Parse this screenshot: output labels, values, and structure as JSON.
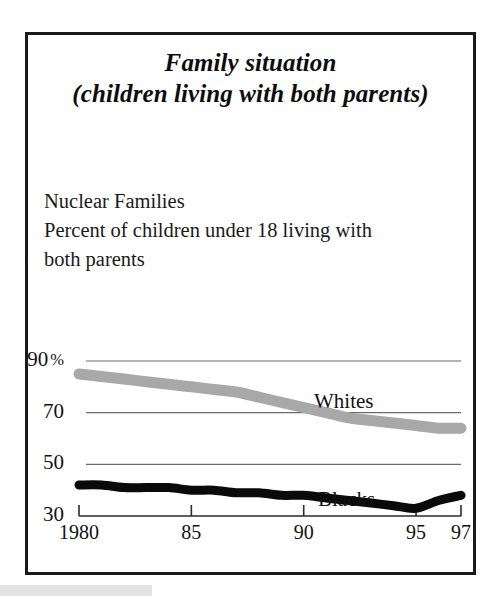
{
  "figure": {
    "title_line_1": "Family situation",
    "title_line_2": "(children living with both parents)",
    "caption_line_1": "Nuclear Families",
    "caption_line_2": "Percent of children under 18 living with",
    "caption_line_3": "both parents"
  },
  "colors": {
    "whites_series": "#a8a8a8",
    "blacks_series": "#0a0a0a",
    "gridline": "#6b6b6b",
    "frame": "#1a1a1a",
    "bottom_bar": "#e3e3e3"
  },
  "chart_data": {
    "type": "line",
    "title": "Family situation (children living with both parents)",
    "subtitle": "Nuclear Families — Percent of children under 18 living with both parents",
    "xlabel": "",
    "ylabel": "",
    "xlim": [
      1980,
      1997
    ],
    "ylim": [
      30,
      90
    ],
    "grid": true,
    "legend_position": "inline-labels",
    "y_ticks": [
      {
        "value": 90,
        "label": "90",
        "suffix": "%"
      },
      {
        "value": 70,
        "label": "70",
        "suffix": ""
      },
      {
        "value": 50,
        "label": "50",
        "suffix": ""
      },
      {
        "value": 30,
        "label": "30",
        "suffix": ""
      }
    ],
    "x_ticks": [
      {
        "value": 1980,
        "label": "1980"
      },
      {
        "value": 1985,
        "label": "85"
      },
      {
        "value": 1990,
        "label": "90"
      },
      {
        "value": 1995,
        "label": "95"
      },
      {
        "value": 1997,
        "label": "97"
      }
    ],
    "x": [
      1980,
      1981,
      1982,
      1983,
      1984,
      1985,
      1986,
      1987,
      1988,
      1989,
      1990,
      1991,
      1992,
      1993,
      1994,
      1995,
      1996,
      1997
    ],
    "series": [
      {
        "name": "Whites",
        "color": "#a8a8a8",
        "label_text": "Whites",
        "values": [
          85,
          84,
          83,
          82,
          81,
          80,
          79,
          78,
          76,
          74,
          72,
          70,
          68,
          67,
          66,
          65,
          64,
          64
        ]
      },
      {
        "name": "Blacks",
        "color": "#0a0a0a",
        "label_text": "Blacks",
        "values": [
          42,
          42,
          41,
          41,
          41,
          40,
          40,
          39,
          39,
          38,
          38,
          37,
          36,
          35,
          34,
          33,
          36,
          38
        ]
      }
    ]
  }
}
